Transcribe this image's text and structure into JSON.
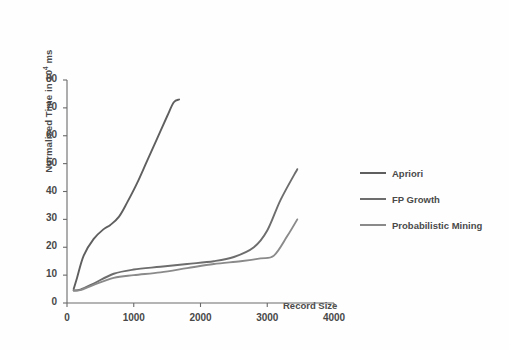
{
  "chart_data": {
    "type": "line",
    "title": "",
    "xlabel": "Record Size",
    "ylabel": "Normalised Time in 10⁴ ms",
    "ylabel_base": "Normalised Time in 10",
    "ylabel_exp": "4",
    "ylabel_unit": " ms",
    "xlim": [
      0,
      4000
    ],
    "ylim": [
      0,
      80
    ],
    "xticks": [
      0,
      1000,
      2000,
      3000,
      4000
    ],
    "yticks": [
      0,
      10,
      20,
      30,
      40,
      50,
      60,
      70,
      80
    ],
    "xtick_labels": [
      "0",
      "1000",
      "2000",
      "3000",
      "4000"
    ],
    "ytick_labels": [
      "0",
      "10",
      "20",
      "30",
      "40",
      "50",
      "60",
      "70",
      "80"
    ],
    "grid": false,
    "legend_position": "right",
    "line_color": "#6d6d6d",
    "axis_color": "#6a6a6a",
    "series": [
      {
        "name": "Apriori",
        "color": "#5f5f5f",
        "x": [
          100,
          150,
          250,
          400,
          550,
          650,
          780,
          900,
          1050,
          1200,
          1350,
          1500,
          1600,
          1680
        ],
        "y": [
          5,
          9,
          17,
          23,
          26.5,
          28,
          31,
          36,
          43,
          51,
          59,
          67,
          72,
          73
        ]
      },
      {
        "name": "FP Growth",
        "color": "#6d6d6d",
        "x": [
          100,
          200,
          400,
          700,
          1000,
          1400,
          1800,
          2200,
          2500,
          2800,
          3000,
          3200,
          3450
        ],
        "y": [
          4.5,
          4.8,
          7,
          10.5,
          12,
          13,
          14,
          15,
          16.5,
          20,
          26,
          37,
          48
        ]
      },
      {
        "name": "Probabilistic Mining",
        "color": "#8a8a8a",
        "x": [
          100,
          200,
          400,
          700,
          1000,
          1400,
          1800,
          2200,
          2600,
          2900,
          3100,
          3300,
          3450
        ],
        "y": [
          4.5,
          4.6,
          6.5,
          9,
          10,
          11,
          12.5,
          14,
          15,
          16,
          17,
          24,
          30
        ]
      }
    ]
  },
  "legend": {
    "items": [
      {
        "label": "Apriori"
      },
      {
        "label": "FP Growth"
      },
      {
        "label": "Probabilistic Mining"
      }
    ]
  }
}
